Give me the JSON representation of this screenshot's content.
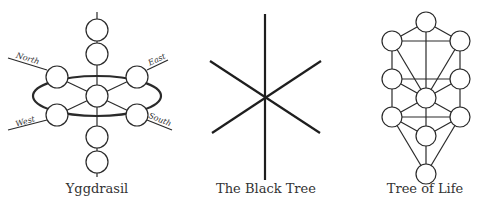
{
  "colors": {
    "stroke": "#2a2a2a",
    "text": "#333333",
    "background": "#ffffff"
  },
  "figures": [
    {
      "id": "yggdrasil",
      "caption": "Yggdrasil",
      "directions": {
        "north": "North",
        "east": "East",
        "west": "West",
        "south": "South"
      }
    },
    {
      "id": "black-tree",
      "caption": "The Black Tree"
    },
    {
      "id": "tree-of-life",
      "caption": "Tree of Life"
    }
  ]
}
